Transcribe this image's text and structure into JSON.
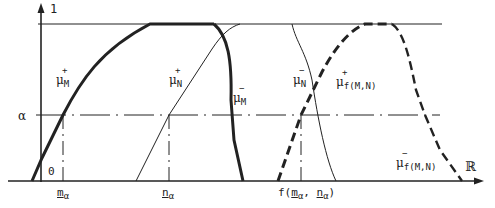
{
  "figure": {
    "type": "fuzzy-membership-functions",
    "y_axis": {
      "top_label": "1",
      "alpha_label": "α",
      "origin_label": "0"
    },
    "x_axis": {
      "label": "ℝ"
    },
    "x_ticks": {
      "m_alpha": {
        "base": "m",
        "sub": "α"
      },
      "n_alpha": {
        "base": "n",
        "sub": "α"
      },
      "f_label": {
        "prefix": "f(",
        "m": "m",
        "m_sub": "α",
        "sep": ", ",
        "n": "n",
        "n_sub": "α",
        "suffix": ")"
      }
    },
    "curves": [
      {
        "id": "mu_M_plus",
        "symbol": "μ",
        "sup": "+",
        "sub": "M",
        "style": "thick-solid"
      },
      {
        "id": "mu_M_minus",
        "symbol": "μ",
        "sup": "−",
        "sub": "M",
        "style": "thick-solid"
      },
      {
        "id": "mu_N_plus",
        "symbol": "μ",
        "sup": "+",
        "sub": "N",
        "style": "thin-solid"
      },
      {
        "id": "mu_N_minus",
        "symbol": "μ",
        "sup": "−",
        "sub": "N",
        "style": "thin-solid"
      },
      {
        "id": "mu_f_plus",
        "symbol": "μ",
        "sup": "+",
        "sub": "f(M,N)",
        "style": "thick-dashed"
      },
      {
        "id": "mu_f_minus",
        "symbol": "μ",
        "sup": "−",
        "sub": "f(M,N)",
        "style": "thick-dashed"
      }
    ]
  },
  "colors": {
    "ink": "#222222",
    "background": "#ffffff"
  }
}
